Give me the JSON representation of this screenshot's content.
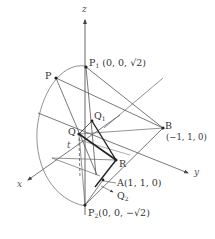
{
  "diagram": {
    "type": "3d-geometry",
    "axes": {
      "x": "x",
      "y": "y",
      "z": "z"
    },
    "points": {
      "P1": {
        "name": "P",
        "sub": "1",
        "coords": "(0, 0, √2)"
      },
      "P2": {
        "name": "P",
        "sub": "2",
        "coords": "(0, 0, −√2)"
      },
      "P": {
        "name": "P"
      },
      "Q": {
        "name": "Q"
      },
      "Q1": {
        "name": "Q",
        "sub": "1"
      },
      "Q2": {
        "name": "Q",
        "sub": "2"
      },
      "R": {
        "name": "R"
      },
      "A": {
        "name": "A",
        "coords": "(1, 1, 0)"
      },
      "B": {
        "name": "B",
        "coords": "(−1, 1, 0)"
      }
    },
    "param_label": "t",
    "colors": {
      "line": "#555555",
      "bold": "#222222",
      "background": "#ffffff"
    }
  }
}
